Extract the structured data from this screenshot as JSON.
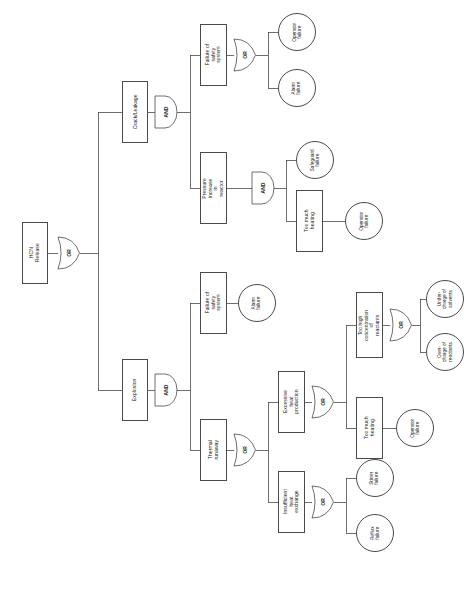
{
  "diagram": {
    "type": "fault-tree",
    "orientation": "rotated-90-left",
    "stroke_color": "#4a4a4a",
    "text_color": "#1a1a1a",
    "background": "#ffffff"
  },
  "gates": {
    "or_label": "OR",
    "and_label": "AND",
    "root_gate": "OR",
    "crack_gate": "AND",
    "safety_top_gate": "OR",
    "pressure_gate": "AND",
    "explosion_gate": "AND",
    "thermal_gate": "OR",
    "excessive_gate": "OR",
    "concentration_gate": "OR",
    "insufficient_gate": "OR"
  },
  "nodes": {
    "root": {
      "label": "HCN Release",
      "kind": "top-event"
    },
    "crack_leakage": {
      "label": "Crack/Leakage",
      "kind": "intermediate-event"
    },
    "failure_safety_top": {
      "label": "Failure of safety\nsystem",
      "kind": "intermediate-event"
    },
    "operator_failure_1": {
      "label": "Operator\nfailure",
      "kind": "basic-event"
    },
    "alarm_failure_1": {
      "label": "Alarm\nfailure",
      "kind": "basic-event"
    },
    "pressure_increase": {
      "label": "Pressure increase in\nreactor",
      "kind": "intermediate-event"
    },
    "safeguard_failure": {
      "label": "Safeguard\nfailure",
      "kind": "basic-event"
    },
    "too_much_heating_1": {
      "label": "Too much heating",
      "kind": "intermediate-event"
    },
    "operator_failure_2": {
      "label": "Operator\nfailure",
      "kind": "basic-event"
    },
    "explosion": {
      "label": "Explosion",
      "kind": "intermediate-event"
    },
    "failure_safety_low": {
      "label": "Failure of safety\nsystem",
      "kind": "intermediate-event"
    },
    "alarm_failure_2": {
      "label": "Alarm\nfailure",
      "kind": "basic-event"
    },
    "thermal_runaway": {
      "label": "Thermal runaway",
      "kind": "intermediate-event"
    },
    "excessive_heat": {
      "label": "Excessive heat\nproduction",
      "kind": "intermediate-event"
    },
    "too_high_conc": {
      "label": "Too high\nconcentration of\nreactants",
      "kind": "intermediate-event"
    },
    "under_charge": {
      "label": "Under-\ncharge of\nsolvents",
      "kind": "basic-event"
    },
    "over_charge": {
      "label": "Over-\ncharge of\nreactants",
      "kind": "basic-event"
    },
    "too_much_heating_2": {
      "label": "Too much heating",
      "kind": "intermediate-event"
    },
    "operator_failure_3": {
      "label": "Operator\nfailure",
      "kind": "basic-event"
    },
    "insufficient_heat": {
      "label": "Insufficient heat\nexchange",
      "kind": "intermediate-event"
    },
    "stirrer_failure": {
      "label": "Stirrer\nfailure",
      "kind": "basic-event"
    },
    "reflux_failure": {
      "label": "Reflux\nfailure",
      "kind": "basic-event"
    }
  }
}
